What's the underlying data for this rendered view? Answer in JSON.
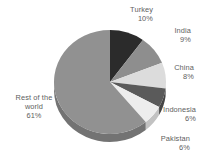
{
  "chart_data": {
    "type": "pie",
    "title": "",
    "subtitle": "",
    "xlabel": "",
    "ylabel": "",
    "legend_position": "outside-labels",
    "grid": false,
    "units": "percent",
    "start_angle_deg": 0,
    "direction": "clockwise",
    "style": "3d",
    "categories": [
      "Turkey",
      "India",
      "China",
      "Indonesia",
      "Pakistan",
      "Rest of the world"
    ],
    "values": [
      10,
      9,
      8,
      6,
      6,
      61
    ],
    "labels": [
      "10%",
      "9%",
      "8%",
      "6%",
      "6%",
      "61%"
    ],
    "colors": [
      "#2b2b2b",
      "#8e8e8e",
      "#dcdcdc",
      "#5a5a5a",
      "#ededed",
      "#919191"
    ],
    "slices": [
      {
        "name": "Turkey",
        "value": 10,
        "label": "10%",
        "color": "#2b2b2b",
        "side_color": "#1f1f1f"
      },
      {
        "name": "India",
        "value": 9,
        "label": "9%",
        "color": "#8e8e8e",
        "side_color": "#707070"
      },
      {
        "name": "China",
        "value": 8,
        "label": "8%",
        "color": "#dcdcdc",
        "side_color": "#b4b4b4"
      },
      {
        "name": "Indonesia",
        "value": 6,
        "label": "6%",
        "color": "#5a5a5a",
        "side_color": "#454545"
      },
      {
        "name": "Pakistan",
        "value": 6,
        "label": "6%",
        "color": "#ededed",
        "side_color": "#c2c2c2"
      },
      {
        "name": "Rest of the world",
        "value": 61,
        "label": "61%",
        "color": "#919191",
        "side_color": "#737373"
      }
    ]
  },
  "labels": {
    "turkey": {
      "name": "Turkey",
      "value": "10%"
    },
    "india": {
      "name": "India",
      "value": "9%"
    },
    "china": {
      "name": "China",
      "value": "8%"
    },
    "indonesia": {
      "name": "Indonesia",
      "value": "6%"
    },
    "pakistan": {
      "name": "Pakistan",
      "value": "6%"
    },
    "rest": {
      "line1": "Rest of the",
      "line2": "world",
      "value": "61%"
    }
  },
  "geometry": {
    "cx": 110,
    "cy": 82,
    "rx": 56,
    "ry": 52,
    "depth": 8
  }
}
